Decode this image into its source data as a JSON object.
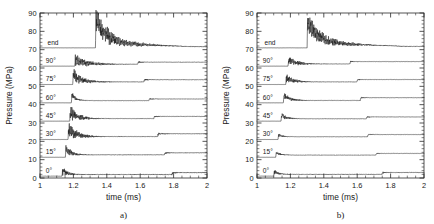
{
  "figure": {
    "background": "#ffffff",
    "ink_color": "#1a1a1a",
    "panel_count": 2
  },
  "chart_data": [
    {
      "type": "line",
      "title": "",
      "caption": "a)",
      "xlabel": "time (ms)",
      "ylabel": "Pressure (MPa)",
      "xlim": [
        1,
        2
      ],
      "ylim": [
        0,
        90
      ],
      "xticks": [
        1,
        1.2,
        1.4,
        1.6,
        1.8,
        2
      ],
      "xtick_labels": [
        "1",
        "1.2",
        "1.4",
        "1.6",
        "1.8",
        "2"
      ],
      "yticks": [
        0,
        10,
        20,
        30,
        40,
        50,
        60,
        70,
        80,
        90
      ],
      "ytick_labels": [
        "0",
        "10",
        "20",
        "30",
        "40",
        "50",
        "60",
        "70",
        "80",
        "90"
      ],
      "x_minor_per_major": 4,
      "y_minor_per_major": 5,
      "grid": false,
      "legend": "inline-left-labels",
      "note": "Stacked pressure traces, each offset by 10 MPa; labels drawn inside plot at left of each baseline.",
      "series": [
        {
          "name": "0",
          "label": "0°",
          "baseline": 1.0,
          "label_x": 1.035,
          "onset": 1.132,
          "peak": 4.6,
          "ring_amp": 2.1,
          "ring_freq": 150,
          "ring_decay": 26,
          "plateau": 1.9,
          "step_time": 1.79,
          "step_height": 1.0,
          "step_ring_amp": 0.55,
          "noise": 0.26
        },
        {
          "name": "15",
          "label": "15°",
          "baseline": 11.3,
          "label_x": 1.035,
          "onset": 1.152,
          "peak": 16.4,
          "ring_amp": 2.5,
          "ring_freq": 140,
          "ring_decay": 22,
          "plateau": 12.6,
          "step_time": 1.745,
          "step_height": 1.1,
          "step_ring_amp": 0.5,
          "noise": 0.16
        },
        {
          "name": "30",
          "label": "30°",
          "baseline": 21.0,
          "label_x": 1.035,
          "onset": 1.168,
          "peak": 27.0,
          "ring_amp": 3.6,
          "ring_freq": 180,
          "ring_decay": 15,
          "plateau": 22.6,
          "step_time": 1.705,
          "step_height": 1.5,
          "step_ring_amp": 0.7,
          "noise": 0.18
        },
        {
          "name": "45",
          "label": "45°",
          "baseline": 31.0,
          "label_x": 1.035,
          "onset": 1.178,
          "peak": 36.4,
          "ring_amp": 3.3,
          "ring_freq": 170,
          "ring_decay": 16,
          "plateau": 32.4,
          "step_time": 1.682,
          "step_height": 1.2,
          "step_ring_amp": 0.45,
          "noise": 0.15
        },
        {
          "name": "60",
          "label": "60°",
          "baseline": 41.0,
          "label_x": 1.035,
          "onset": 1.188,
          "peak": 45.8,
          "ring_amp": 1.5,
          "ring_freq": 160,
          "ring_decay": 30,
          "plateau": 42.2,
          "step_time": 1.652,
          "step_height": 0.9,
          "step_ring_amp": 0.35,
          "noise": 0.13
        },
        {
          "name": "75",
          "label": "75°",
          "baseline": 51.0,
          "label_x": 1.035,
          "onset": 1.196,
          "peak": 56.6,
          "ring_amp": 3.0,
          "ring_freq": 155,
          "ring_decay": 14,
          "plateau": 52.4,
          "step_time": 1.622,
          "step_height": 1.2,
          "step_ring_amp": 0.55,
          "noise": 0.15
        },
        {
          "name": "90",
          "label": "90°",
          "baseline": 61.0,
          "label_x": 1.035,
          "onset": 1.208,
          "peak": 64.9,
          "ring_amp": 2.9,
          "ring_freq": 120,
          "ring_decay": 11,
          "plateau": 62.1,
          "step_time": 1.585,
          "step_height": 1.1,
          "step_ring_amp": 0.4,
          "noise": 0.13
        },
        {
          "name": "end",
          "label": "end",
          "baseline": 71.0,
          "label_x": 1.045,
          "onset": 1.332,
          "peak": 87.0,
          "ring_amp": 5.4,
          "ring_freq": 130,
          "ring_decay": 7,
          "plateau": 73.4,
          "step_time": null,
          "step_height": 0,
          "step_ring_amp": 0,
          "noise": 0.2,
          "tail_decay_to": 71.6
        }
      ]
    },
    {
      "type": "line",
      "title": "",
      "caption": "b)",
      "xlabel": "time (ms)",
      "ylabel": "Pressure (MPa)",
      "xlim": [
        1,
        2
      ],
      "ylim": [
        0,
        90
      ],
      "xticks": [
        1,
        1.2,
        1.4,
        1.6,
        1.8,
        2
      ],
      "xtick_labels": [
        "1",
        "1.2",
        "1.4",
        "1.6",
        "1.8",
        "2"
      ],
      "yticks": [
        0,
        10,
        20,
        30,
        40,
        50,
        60,
        70,
        80,
        90
      ],
      "ytick_labels": [
        "0",
        "10",
        "20",
        "30",
        "40",
        "50",
        "60",
        "70",
        "80",
        "90"
      ],
      "x_minor_per_major": 4,
      "y_minor_per_major": 5,
      "grid": false,
      "legend": "inline-left-labels",
      "note": "Same stacked layout; onsets occur earlier for lower angles and traces are less oscillatory than panel a).",
      "series": [
        {
          "name": "0",
          "label": "0°",
          "baseline": 1.0,
          "label_x": 1.035,
          "onset": 1.1,
          "peak": 3.8,
          "ring_amp": 1.1,
          "ring_freq": 150,
          "ring_decay": 28,
          "plateau": 2.0,
          "step_time": 1.748,
          "step_height": 1.0,
          "step_ring_amp": 0.5,
          "noise": 0.22
        },
        {
          "name": "15",
          "label": "15°",
          "baseline": 11.3,
          "label_x": 1.035,
          "onset": 1.112,
          "peak": 14.1,
          "ring_amp": 0.9,
          "ring_freq": 150,
          "ring_decay": 30,
          "plateau": 12.5,
          "step_time": 1.712,
          "step_height": 0.9,
          "step_ring_amp": 0.3,
          "noise": 0.12
        },
        {
          "name": "30",
          "label": "30°",
          "baseline": 21.0,
          "label_x": 1.035,
          "onset": 1.126,
          "peak": 23.6,
          "ring_amp": 0.8,
          "ring_freq": 150,
          "ring_decay": 32,
          "plateau": 22.5,
          "step_time": 1.662,
          "step_height": 1.2,
          "step_ring_amp": 0.35,
          "noise": 0.12
        },
        {
          "name": "45",
          "label": "45°",
          "baseline": 31.0,
          "label_x": 1.035,
          "onset": 1.144,
          "peak": 34.6,
          "ring_amp": 1.5,
          "ring_freq": 170,
          "ring_decay": 24,
          "plateau": 32.3,
          "step_time": 1.655,
          "step_height": 1.0,
          "step_ring_amp": 0.35,
          "noise": 0.12
        },
        {
          "name": "60",
          "label": "60°",
          "baseline": 41.0,
          "label_x": 1.035,
          "onset": 1.158,
          "peak": 45.4,
          "ring_amp": 1.9,
          "ring_freq": 165,
          "ring_decay": 20,
          "plateau": 42.3,
          "step_time": 1.618,
          "step_height": 1.5,
          "step_ring_amp": 0.4,
          "noise": 0.13
        },
        {
          "name": "75",
          "label": "75°",
          "baseline": 51.0,
          "label_x": 1.035,
          "onset": 1.172,
          "peak": 55.0,
          "ring_amp": 2.0,
          "ring_freq": 150,
          "ring_decay": 17,
          "plateau": 52.4,
          "step_time": 1.598,
          "step_height": 1.3,
          "step_ring_amp": 0.45,
          "noise": 0.13
        },
        {
          "name": "90",
          "label": "90°",
          "baseline": 61.0,
          "label_x": 1.035,
          "onset": 1.186,
          "peak": 64.6,
          "ring_amp": 2.2,
          "ring_freq": 145,
          "ring_decay": 15,
          "plateau": 62.2,
          "step_time": 1.556,
          "step_height": 1.3,
          "step_ring_amp": 0.4,
          "noise": 0.12
        },
        {
          "name": "end",
          "label": "end",
          "baseline": 71.0,
          "label_x": 1.045,
          "onset": 1.3,
          "peak": 86.5,
          "ring_amp": 5.0,
          "ring_freq": 135,
          "ring_decay": 7.5,
          "plateau": 73.6,
          "step_time": null,
          "step_height": 0,
          "step_ring_amp": 0,
          "noise": 0.22,
          "tail_decay_to": 71.8
        }
      ]
    }
  ]
}
